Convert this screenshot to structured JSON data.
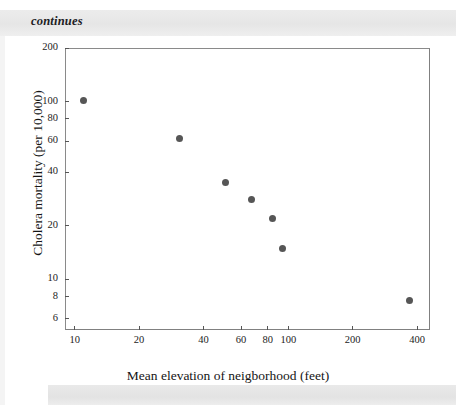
{
  "caption": {
    "text": "continues"
  },
  "chart_data": {
    "type": "scatter",
    "title": "",
    "xlabel": "Mean elevation of neigborhood (feet)",
    "ylabel": "Cholera mortality (per 10,000)",
    "xscale": "log",
    "yscale": "log",
    "xlim": [
      9,
      460
    ],
    "ylim": [
      5.2,
      200
    ],
    "grid": false,
    "legend": null,
    "xticks": [
      10,
      20,
      40,
      60,
      80,
      100,
      200,
      400
    ],
    "xtick_labels": [
      "10",
      "20",
      "40",
      "60",
      "80",
      "100",
      "200",
      "400"
    ],
    "yticks": [
      200,
      100,
      80,
      60,
      40,
      20,
      10,
      8,
      6
    ],
    "ytick_labels": [
      "200",
      "100",
      "80",
      "60",
      "40",
      "20",
      "10",
      "8",
      "6"
    ],
    "marker_color": "#565656",
    "marker_size": 7,
    "series": [
      {
        "name": "London districts",
        "x": [
          11,
          31,
          51,
          67,
          84,
          94,
          370
        ],
        "y": [
          101,
          62,
          35,
          28,
          22,
          15,
          7.6
        ]
      }
    ]
  },
  "colors": {
    "marker": "#565656",
    "axis": "#808080",
    "text": "#1b1b1b",
    "band": "#e8e8e8"
  }
}
